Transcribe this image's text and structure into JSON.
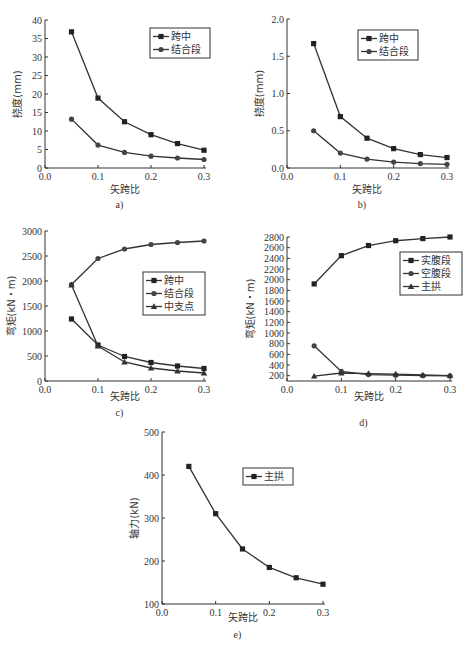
{
  "chart_data": [
    {
      "id": "a",
      "caption": "a)",
      "type": "line",
      "xlabel": "矢跨比",
      "ylabel": "挠度(mm)",
      "x": [
        0.05,
        0.1,
        0.15,
        0.2,
        0.25,
        0.3
      ],
      "xlim": [
        0.0,
        0.3
      ],
      "xticks": [
        "0.0",
        "0.1",
        "0.2",
        "0.3"
      ],
      "ylim": [
        0,
        40
      ],
      "yticks": [
        "0",
        "5",
        "10",
        "15",
        "20",
        "25",
        "30",
        "35",
        "40"
      ],
      "grid": false,
      "legend_position": "upper right",
      "series": [
        {
          "name": "跨中",
          "marker": "square",
          "values": [
            36.8,
            18.9,
            12.5,
            9.0,
            6.6,
            4.8
          ]
        },
        {
          "name": "结合段",
          "marker": "circle",
          "values": [
            13.2,
            6.2,
            4.2,
            3.2,
            2.7,
            2.3
          ]
        }
      ]
    },
    {
      "id": "b",
      "caption": "b)",
      "type": "line",
      "xlabel": "矢跨比",
      "ylabel": "挠度(mm)",
      "x": [
        0.05,
        0.1,
        0.15,
        0.2,
        0.25,
        0.3
      ],
      "xlim": [
        0.0,
        0.3
      ],
      "xticks": [
        "0.0",
        "0.1",
        "0.2",
        "0.3"
      ],
      "ylim": [
        0.0,
        2.0
      ],
      "yticks": [
        "0.0",
        "0.5",
        "1.0",
        "1.5",
        "2.0"
      ],
      "grid": false,
      "legend_position": "upper right",
      "series": [
        {
          "name": "跨中",
          "marker": "square",
          "values": [
            1.67,
            0.69,
            0.4,
            0.26,
            0.18,
            0.14
          ]
        },
        {
          "name": "结合段",
          "marker": "circle",
          "values": [
            0.5,
            0.2,
            0.12,
            0.08,
            0.06,
            0.05
          ]
        }
      ]
    },
    {
      "id": "c",
      "caption": "c)",
      "type": "line",
      "xlabel": "矢跨比",
      "ylabel": "弯矩(kN・m)",
      "x": [
        0.05,
        0.1,
        0.15,
        0.2,
        0.25,
        0.3
      ],
      "xlim": [
        0.0,
        0.3
      ],
      "xticks": [
        "0.0",
        "0.1",
        "0.2",
        "0.3"
      ],
      "ylim": [
        0,
        3000
      ],
      "yticks": [
        "0",
        "500",
        "1000",
        "1500",
        "2000",
        "2500",
        "3000"
      ],
      "grid": false,
      "legend_position": "center right",
      "series": [
        {
          "name": "跨中",
          "marker": "square",
          "values": [
            1240,
            720,
            490,
            370,
            300,
            250
          ]
        },
        {
          "name": "结合段",
          "marker": "circle",
          "values": [
            1930,
            2450,
            2640,
            2730,
            2770,
            2800
          ]
        },
        {
          "name": "中支点",
          "marker": "triangle",
          "values": [
            1920,
            700,
            380,
            260,
            200,
            160
          ]
        }
      ]
    },
    {
      "id": "d",
      "caption": "d)",
      "type": "line",
      "xlabel": "矢跨比",
      "ylabel": "弯矩(kN・m)",
      "x": [
        0.05,
        0.1,
        0.15,
        0.2,
        0.25,
        0.3
      ],
      "xlim": [
        0.0,
        0.3
      ],
      "xticks": [
        "0.0",
        "0.1",
        "0.2",
        "0.3"
      ],
      "ylim": [
        100,
        2800
      ],
      "yticks": [
        "200",
        "400",
        "600",
        "800",
        "1000",
        "1200",
        "1400",
        "1600",
        "1800",
        "2000",
        "2200",
        "2400",
        "2600",
        "2800"
      ],
      "grid": false,
      "legend_position": "upper right",
      "series": [
        {
          "name": "实腹段",
          "marker": "square",
          "values": [
            1920,
            2450,
            2640,
            2730,
            2770,
            2800
          ]
        },
        {
          "name": "空腹段",
          "marker": "circle",
          "values": [
            760,
            280,
            220,
            210,
            200,
            195
          ]
        },
        {
          "name": "主拱",
          "marker": "triangle",
          "values": [
            190,
            250,
            240,
            230,
            215,
            200
          ]
        }
      ]
    },
    {
      "id": "e",
      "caption": "e)",
      "type": "line",
      "xlabel": "矢跨比",
      "ylabel": "轴力(kN)",
      "x": [
        0.05,
        0.1,
        0.15,
        0.2,
        0.25,
        0.3
      ],
      "xlim": [
        0.0,
        0.3
      ],
      "xticks": [
        "0.0",
        "0.1",
        "0.2",
        "0.3"
      ],
      "ylim": [
        100,
        500
      ],
      "yticks": [
        "100",
        "200",
        "300",
        "400",
        "500"
      ],
      "grid": false,
      "legend_position": "upper right",
      "series": [
        {
          "name": "主拱",
          "marker": "square",
          "values": [
            420,
            310,
            228,
            185,
            161,
            146
          ]
        }
      ]
    }
  ]
}
